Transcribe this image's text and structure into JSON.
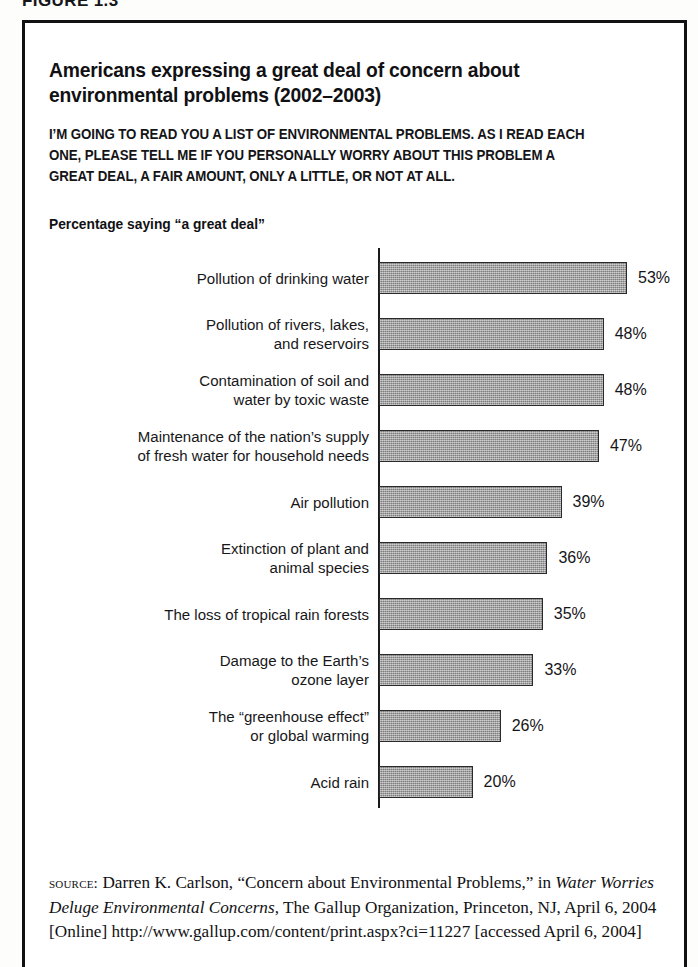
{
  "figure": {
    "caption": "FIGURE 1.3"
  },
  "card": {
    "title": "Americans expressing a great deal of concern about environmental problems (2002–2003)",
    "question": "I’M GOING TO READ YOU A LIST OF ENVIRONMENTAL PROBLEMS. AS I READ EACH ONE, PLEASE TELL ME IF YOU PERSONALLY WORRY ABOUT THIS PROBLEM A GREAT DEAL, A FAIR AMOUNT, ONLY A LITTLE, OR NOT AT ALL.",
    "subhead": "Percentage saying “a great deal”"
  },
  "source": {
    "kicker": "source:",
    "text_before_italic": " Darren K. Carlson, “Concern about Environmental Problems,” in ",
    "italic_title": "Water Worries Deluge Environmental Concerns",
    "text_after_italic": ", The Gallup Organization, Princeton, NJ, April 6, 2004 [Online] http://www.gallup.com/content/print.aspx?ci=11227 [accessed April 6, 2004]"
  },
  "colors": {
    "bar_fill": "#9a9a9a",
    "bar_border": "#2a2a2d",
    "frame": "#111114",
    "text": "#111114",
    "background": "#ffffff"
  },
  "chart_data": {
    "type": "bar",
    "orientation": "horizontal",
    "title": "Americans expressing a great deal of concern about environmental problems (2002–2003)",
    "subtitle": "Percentage saying “a great deal”",
    "xlabel": "",
    "ylabel": "",
    "xlim": [
      0,
      53
    ],
    "grid": false,
    "legend": false,
    "unit": "%",
    "categories": [
      "Pollution of drinking water",
      "Pollution of rivers, lakes,\nand reservoirs",
      "Contamination of soil and\nwater by toxic waste",
      "Maintenance of the nation’s supply\nof fresh water for household needs",
      "Air pollution",
      "Extinction of plant and\nanimal species",
      "The loss of tropical rain forests",
      "Damage to the Earth’s\nozone layer",
      "The “greenhouse effect”\nor global warming",
      "Acid rain"
    ],
    "values": [
      53,
      48,
      48,
      47,
      39,
      36,
      35,
      33,
      26,
      20
    ],
    "value_labels": [
      "53%",
      "48%",
      "48%",
      "47%",
      "39%",
      "36%",
      "35%",
      "33%",
      "26%",
      "20%"
    ]
  }
}
